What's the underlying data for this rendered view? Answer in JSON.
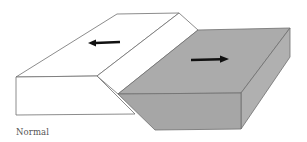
{
  "figure": {
    "caption": "Normal",
    "colors": {
      "footwall_fill": "#ffffff",
      "hanging_wall_top": "#ababab",
      "hanging_wall_front": "#a6a6a6",
      "hanging_wall_side": "#b0b0b0",
      "outline": "#6e6e6e",
      "arrow": "#111111",
      "caption": "#555555"
    },
    "blocks": [
      {
        "name": "footwall",
        "label": "",
        "arrow_direction": "left"
      },
      {
        "name": "hanging-wall",
        "label": "",
        "arrow_direction": "right"
      }
    ]
  }
}
